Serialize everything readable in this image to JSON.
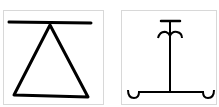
{
  "figure": {
    "panels": [
      {
        "id": "left",
        "symbol": "triangle-under-bar-glyph",
        "description": "Horizontal bar with a triangle hanging from its center",
        "stroke_color": "#000000",
        "border_color": "#d8d8d8"
      },
      {
        "id": "right",
        "symbol": "stand-with-hooks-glyph",
        "description": "Vertical stem with T-cap, curled arms near top, and base line with curled ends",
        "stroke_color": "#000000",
        "border_color": "#d8d8d8"
      }
    ]
  }
}
